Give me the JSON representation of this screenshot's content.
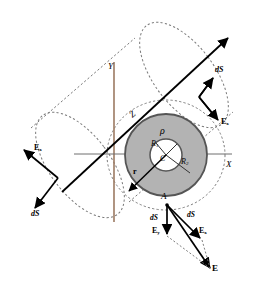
{
  "figure": {
    "colors": {
      "shell_fill": "#b3b3b3",
      "shell_stroke": "#555555",
      "dashed_guide": "#7a7a7a",
      "axis_y_line": "#9c7a62",
      "axis_x_line": "#6f6f6f",
      "vector": "#000000",
      "background": "#ffffff"
    },
    "labels": {
      "axis_y": "Y",
      "axis_x": "X",
      "axis_z": "Z",
      "charge_density": "ρ",
      "center": "C",
      "inner_radius": "R",
      "inner_radius_sub": "1",
      "outer_radius": "R",
      "outer_radius_sub": "2",
      "radius_vector": "r",
      "point_a": "A",
      "ds_top_right": "dS",
      "ex_top_right": "E",
      "ex_top_right_sub": "x",
      "ex_left": "E",
      "ex_left_sub": "x",
      "ds_left": "dS",
      "ds_bottom_vertical": "dS",
      "ey_bottom": "E",
      "ey_bottom_sub": "y",
      "ds_bottom_diag": "dS",
      "ex_bottom": "E",
      "ex_bottom_sub": "x",
      "e_resultant": "E"
    }
  }
}
